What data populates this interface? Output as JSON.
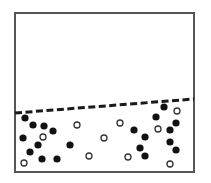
{
  "title": "Particles settled in a container below a dashed boundary line",
  "colors": {
    "background": "#ffffff",
    "frame": "#555555",
    "dashed_line": "#1a1a1a",
    "filled_particle": "#111111",
    "open_particle_stroke": "#333333",
    "open_particle_fill": "#ffffff"
  },
  "container": {
    "x": 15,
    "y": 13,
    "width": 179,
    "height": 159,
    "stroke_width": 2
  },
  "boundary_line": {
    "style": "dashed",
    "x1": 15,
    "y1": 113,
    "x2": 194,
    "y2": 99,
    "stroke_width": 3,
    "dash": 7,
    "gap": 3.5
  },
  "particle_radius": 3.6,
  "filled_particles": [
    {
      "x": 25,
      "y": 118
    },
    {
      "x": 33,
      "y": 125
    },
    {
      "x": 44,
      "y": 126
    },
    {
      "x": 53,
      "y": 131
    },
    {
      "x": 23,
      "y": 138
    },
    {
      "x": 38,
      "y": 145
    },
    {
      "x": 30,
      "y": 152
    },
    {
      "x": 42,
      "y": 159
    },
    {
      "x": 57,
      "y": 159
    },
    {
      "x": 70,
      "y": 145
    },
    {
      "x": 134,
      "y": 130
    },
    {
      "x": 145,
      "y": 137
    },
    {
      "x": 140,
      "y": 148
    },
    {
      "x": 145,
      "y": 156
    },
    {
      "x": 164,
      "y": 107
    },
    {
      "x": 156,
      "y": 117
    },
    {
      "x": 176,
      "y": 123
    },
    {
      "x": 170,
      "y": 130
    },
    {
      "x": 170,
      "y": 142
    },
    {
      "x": 176,
      "y": 150
    }
  ],
  "open_particles": [
    {
      "x": 43,
      "y": 137
    },
    {
      "x": 24,
      "y": 163
    },
    {
      "x": 77,
      "y": 125
    },
    {
      "x": 104,
      "y": 138
    },
    {
      "x": 120,
      "y": 123
    },
    {
      "x": 89,
      "y": 156
    },
    {
      "x": 128,
      "y": 157
    },
    {
      "x": 177,
      "y": 111
    },
    {
      "x": 158,
      "y": 129
    },
    {
      "x": 170,
      "y": 164
    }
  ],
  "counts": {
    "filled": 20,
    "open": 10
  }
}
